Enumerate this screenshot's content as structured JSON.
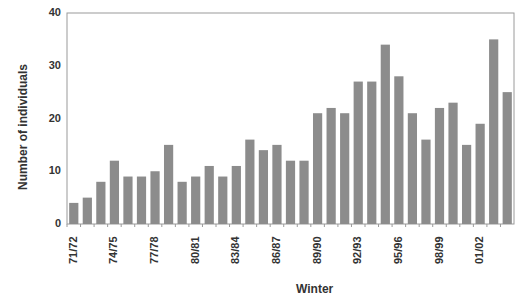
{
  "chart_data": {
    "type": "bar",
    "title": "",
    "xlabel": "Winter",
    "ylabel": "Number of individuals",
    "ylim": [
      0,
      40
    ],
    "yticks": [
      0,
      10,
      20,
      30,
      40
    ],
    "grid": false,
    "legend": null,
    "bar_color": "#8c8c8c",
    "categories": [
      "71/72",
      "72/73",
      "73/74",
      "74/75",
      "75/76",
      "76/77",
      "77/78",
      "78/79",
      "79/80",
      "80/81",
      "81/82",
      "82/83",
      "83/84",
      "84/85",
      "85/86",
      "86/87",
      "87/88",
      "88/89",
      "89/90",
      "90/91",
      "91/92",
      "92/93",
      "93/94",
      "94/95",
      "95/96",
      "96/97",
      "97/98",
      "98/99",
      "99/00",
      "00/01",
      "01/02",
      "02/03",
      "03/04"
    ],
    "xtick_labels_shown": [
      "71/72",
      "74/75",
      "77/78",
      "80/81",
      "83/84",
      "86/87",
      "89/90",
      "92/93",
      "95/96",
      "98/99",
      "01/02"
    ],
    "values": [
      4,
      5,
      8,
      12,
      9,
      9,
      10,
      15,
      8,
      9,
      11,
      9,
      11,
      16,
      14,
      15,
      12,
      12,
      21,
      22,
      21,
      27,
      27,
      34,
      28,
      21,
      16,
      22,
      23,
      15,
      19,
      35,
      25
    ]
  }
}
